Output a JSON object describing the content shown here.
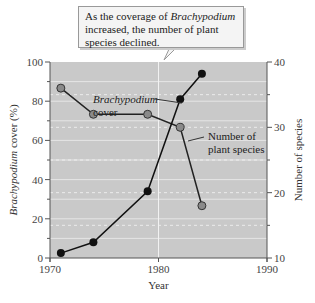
{
  "callout": {
    "line1_pre": "As the coverage of ",
    "line1_italic": "Brachypodium",
    "line2": "increased, the number of plant",
    "line3": "species declined."
  },
  "colors": {
    "plot_bg": "#c9c9c9",
    "cover_line": "#111111",
    "cover_marker": "#111111",
    "species_line": "#222222",
    "species_marker": "#8a8a8a",
    "gridline": "#eeeeee"
  },
  "chart_data": {
    "type": "line",
    "title": "As the coverage of Brachypodium increased, the number of plant species declined.",
    "xlabel": "Year",
    "ylabel": "Brachypodium cover (%)",
    "y2label": "Number of species",
    "xlim": [
      1970,
      1990
    ],
    "ylim": [
      0,
      100
    ],
    "y2lim": [
      10,
      40
    ],
    "x_ticks": [
      1970,
      1980,
      1990
    ],
    "y_ticks": [
      0,
      20,
      40,
      60,
      80,
      100
    ],
    "y2_ticks": [
      10,
      20,
      30,
      40
    ],
    "grid": true,
    "series": [
      {
        "name": "Brachypodium cover",
        "axis": "left",
        "x": [
          1971,
          1974,
          1979,
          1982,
          1984
        ],
        "values": [
          2.5,
          8,
          34,
          81,
          94
        ]
      },
      {
        "name": "Number of plant species",
        "axis": "right",
        "x": [
          1971,
          1974,
          1979,
          1982,
          1984
        ],
        "values": [
          36,
          32,
          32,
          30,
          18
        ]
      }
    ],
    "annotations": [
      {
        "text": "Brachypodium cover",
        "target": "Brachypodium cover"
      },
      {
        "text": "Number of plant species",
        "target": "Number of plant species"
      }
    ]
  },
  "labels": {
    "cover_label_1": "Brachypodium",
    "cover_label_2": "cover",
    "species_label_1": "Number of",
    "species_label_2": "plant species",
    "xlabel": "Year",
    "ylabel_italic": "Brachypodium",
    "ylabel_rest": " cover (%)",
    "y2label": "Number of species"
  }
}
